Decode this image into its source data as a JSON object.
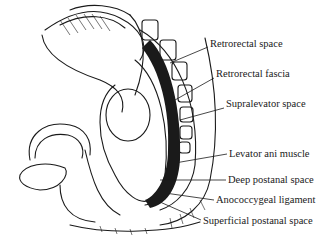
{
  "figure": {
    "colors": {
      "ink": "#1a1a1a",
      "background": "#ffffff"
    }
  },
  "labels": [
    {
      "id": "retrorectal-space",
      "text": "Retrorectal space",
      "x": 210,
      "y": 44
    },
    {
      "id": "retrorectal-fascia",
      "text": "Retrorectal fascia",
      "x": 216,
      "y": 74
    },
    {
      "id": "supralevator-space",
      "text": "Supralevator space",
      "x": 226,
      "y": 104
    },
    {
      "id": "levator-ani-muscle",
      "text": "Levator ani muscle",
      "x": 229,
      "y": 150
    },
    {
      "id": "deep-postanal-space",
      "text": "Deep postanal space",
      "x": 228,
      "y": 176
    },
    {
      "id": "anococcygeal-ligament",
      "text": "Anococcygeal ligament",
      "x": 216,
      "y": 196
    },
    {
      "id": "superficial-postanal-space",
      "text": "Superficial postanal space",
      "x": 203,
      "y": 219
    }
  ]
}
